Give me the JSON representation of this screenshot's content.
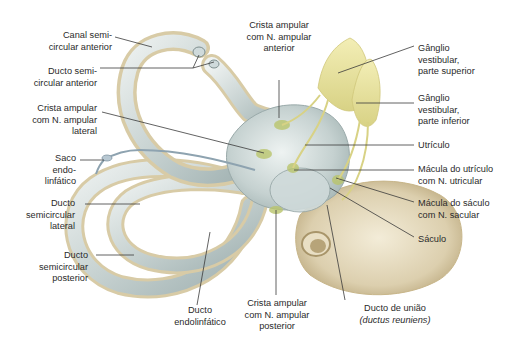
{
  "figure": {
    "colors": {
      "duct_fill": "#c9d3d2",
      "duct_highlight": "#e9efee",
      "bone_rim": "#e6dcc0",
      "bone_shadow": "#b9a77e",
      "nerve": "#e9e39a",
      "macula": "#b8c46a",
      "leader": "#3a3a3a"
    }
  },
  "labels": {
    "canal_semicircular_anterior": [
      "Canal semi-",
      "circular anterior"
    ],
    "ducto_semicircular_anterior": [
      "Ducto semi-",
      "circular anterior"
    ],
    "crista_ampular_lateral": [
      "Crista ampular",
      "com N. ampular",
      "lateral"
    ],
    "saco_endolinfatico": [
      "Saco",
      "endo-",
      "linfático"
    ],
    "ducto_semicircular_lateral": [
      "Ducto",
      "semicircular",
      "lateral"
    ],
    "ducto_semicircular_posterior": [
      "Ducto",
      "semicircular",
      "posterior"
    ],
    "ducto_endolinfatico": [
      "Ducto",
      "endolinfático"
    ],
    "crista_ampular_posterior": [
      "Crista ampular",
      "com N. ampular",
      "posterior"
    ],
    "ducto_de_uniao": [
      "Ducto de união",
      "(ductus reuniens)"
    ],
    "crista_ampular_anterior": [
      "Crista ampular",
      "com N. ampular",
      "anterior"
    ],
    "ganglio_superior": [
      "Gânglio",
      "vestibular,",
      "parte superior"
    ],
    "ganglio_inferior": [
      "Gânglio",
      "vestibular,",
      "parte inferior"
    ],
    "utriculo": [
      "Utrículo"
    ],
    "macula_utriculo": [
      "Mácula do utrículo",
      "com N. utricular"
    ],
    "macula_saculo": [
      "Mácula do sáculo",
      "com N. sacular"
    ],
    "saculo": [
      "Sáculo"
    ]
  }
}
